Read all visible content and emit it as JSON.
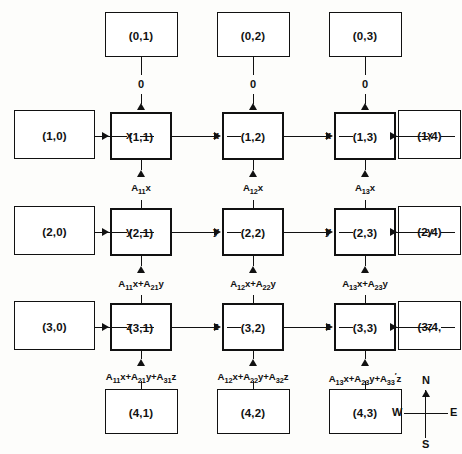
{
  "diagram": {
    "compass": {
      "north": "N",
      "south": "S",
      "east": "E",
      "west": "W"
    },
    "nodes": {
      "top": [
        {
          "id": "n01",
          "label": "(0,1)"
        },
        {
          "id": "n02",
          "label": "(0,2)"
        },
        {
          "id": "n03",
          "label": "(0,3)"
        }
      ],
      "left": [
        {
          "id": "n10",
          "label": "(1,0)"
        },
        {
          "id": "n20",
          "label": "(2,0)"
        },
        {
          "id": "n30",
          "label": "(3,0)"
        }
      ],
      "right": [
        {
          "id": "n14",
          "label": "(1,4)"
        },
        {
          "id": "n24",
          "label": "(2,4)"
        },
        {
          "id": "n34",
          "label": "(3,4,"
        }
      ],
      "bottom": [
        {
          "id": "n41",
          "label": "(4,1)"
        },
        {
          "id": "n42",
          "label": "(4,2)"
        },
        {
          "id": "n43",
          "label": "(4,3)"
        }
      ],
      "grid": [
        {
          "id": "n11",
          "label": "(1,1)"
        },
        {
          "id": "n12",
          "label": "(1,2)"
        },
        {
          "id": "n13",
          "label": "(1,3)"
        },
        {
          "id": "n21",
          "label": "(2,1)"
        },
        {
          "id": "n22",
          "label": "(2,2)"
        },
        {
          "id": "n23",
          "label": "(2,3)"
        },
        {
          "id": "n31",
          "label": "(3,1)"
        },
        {
          "id": "n32",
          "label": "(3,2)"
        },
        {
          "id": "n33",
          "label": "(3,3)"
        }
      ]
    },
    "edge_labels": {
      "top_out": [
        "0",
        "0",
        "0"
      ],
      "row1": [
        "x",
        "x",
        "x",
        "x"
      ],
      "row2": [
        "y",
        "y",
        "y",
        "y"
      ],
      "row3": [
        "z",
        "z",
        "z",
        "z"
      ],
      "vert_row1_to_row2": [
        {
          "terms": [
            {
              "coef": "A",
              "sub": "11",
              "prime": false,
              "var": "x"
            }
          ]
        },
        {
          "terms": [
            {
              "coef": "A",
              "sub": "12",
              "prime": false,
              "var": "x"
            }
          ]
        },
        {
          "terms": [
            {
              "coef": "A",
              "sub": "13",
              "prime": false,
              "var": "x"
            }
          ]
        }
      ],
      "vert_row2_to_row3": [
        {
          "terms": [
            {
              "coef": "A",
              "sub": "11",
              "prime": false,
              "var": "x"
            },
            {
              "coef": "A",
              "sub": "21",
              "prime": false,
              "var": "y"
            }
          ]
        },
        {
          "terms": [
            {
              "coef": "A",
              "sub": "12",
              "prime": false,
              "var": "x"
            },
            {
              "coef": "A",
              "sub": "22",
              "prime": false,
              "var": "y"
            }
          ]
        },
        {
          "terms": [
            {
              "coef": "A",
              "sub": "13",
              "prime": false,
              "var": "x"
            },
            {
              "coef": "A",
              "sub": "23",
              "prime": false,
              "var": "y"
            }
          ]
        }
      ],
      "vert_row3_to_bottom": [
        {
          "terms": [
            {
              "coef": "A",
              "sub": "11",
              "prime": false,
              "var": "x"
            },
            {
              "coef": "A",
              "sub": "21",
              "prime": false,
              "var": "y"
            },
            {
              "coef": "A",
              "sub": "31",
              "prime": false,
              "var": "z"
            }
          ]
        },
        {
          "terms": [
            {
              "coef": "A",
              "sub": "12",
              "prime": false,
              "var": "x"
            },
            {
              "coef": "A",
              "sub": "22",
              "prime": false,
              "var": "y"
            },
            {
              "coef": "A",
              "sub": "32",
              "prime": false,
              "var": "z"
            }
          ]
        },
        {
          "terms": [
            {
              "coef": "A",
              "sub": "13",
              "prime": false,
              "var": "x"
            },
            {
              "coef": "A",
              "sub": "23",
              "prime": false,
              "var": "y"
            },
            {
              "coef": "A",
              "sub": "33",
              "prime": true,
              "var": "z"
            }
          ]
        }
      ]
    }
  }
}
